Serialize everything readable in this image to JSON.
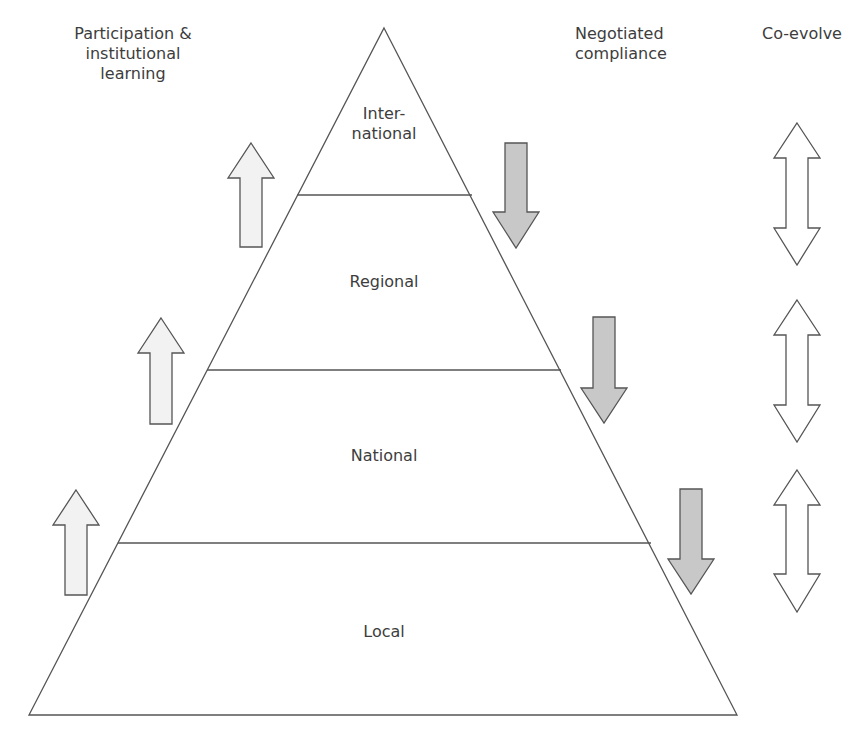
{
  "headers": {
    "left": [
      "Participation &",
      "institutional",
      "learning"
    ],
    "middle": [
      "Negotiated",
      "compliance"
    ],
    "right": [
      "Co-evolve"
    ]
  },
  "levels": [
    {
      "lines": [
        "Inter-",
        "national"
      ]
    },
    {
      "lines": [
        "Regional"
      ]
    },
    {
      "lines": [
        "National"
      ]
    },
    {
      "lines": [
        "Local"
      ]
    }
  ],
  "arrows": {
    "up": {
      "meaning": "Participation & institutional learning",
      "count": 3,
      "fill": "#f2f2f2"
    },
    "down": {
      "meaning": "Negotiated compliance",
      "count": 3,
      "fill": "#c8c8c8"
    },
    "double": {
      "meaning": "Co-evolve",
      "count": 3,
      "fill": "#ffffff"
    }
  },
  "colors": {
    "stroke": "#555555",
    "text": "#3d3d3d"
  }
}
